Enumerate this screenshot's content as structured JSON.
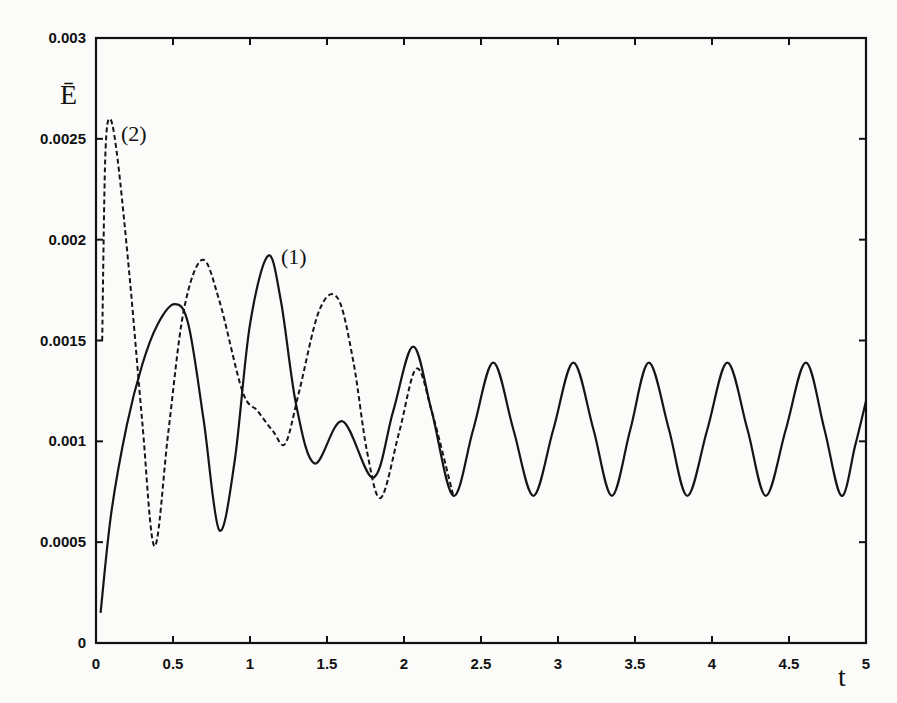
{
  "chart_data": {
    "type": "line",
    "title": "",
    "xlabel": "t",
    "ylabel": "Ē",
    "xlim": [
      0,
      5
    ],
    "ylim": [
      0,
      0.003
    ],
    "grid": false,
    "legend": "none (curves labeled inline)",
    "x_ticks": [
      "0",
      "0.5",
      "1",
      "1.5",
      "2",
      "2.5",
      "3",
      "3.5",
      "4",
      "4.5",
      "5"
    ],
    "y_ticks": [
      "0",
      "0.0005",
      "0.001",
      "0.0015",
      "0.002",
      "0.0025",
      "0.003"
    ],
    "annotations": [
      {
        "text": "(1)",
        "x": 1.21,
        "y": 0.00188,
        "refers_to": "series 1 (solid)"
      },
      {
        "text": "(2)",
        "x": 0.17,
        "y": 0.0025,
        "refers_to": "series 2 (dashed)"
      }
    ],
    "series": [
      {
        "name": "(1)",
        "style": "solid",
        "points": [
          [
            0.03,
            0.00015
          ],
          [
            0.1,
            0.00065
          ],
          [
            0.2,
            0.00108
          ],
          [
            0.3,
            0.00138
          ],
          [
            0.4,
            0.00158
          ],
          [
            0.51,
            0.00168
          ],
          [
            0.6,
            0.00158
          ],
          [
            0.7,
            0.0011
          ],
          [
            0.8,
            0.00056
          ],
          [
            0.9,
            0.0009
          ],
          [
            1.0,
            0.00158
          ],
          [
            1.117,
            0.00192
          ],
          [
            1.2,
            0.0017
          ],
          [
            1.3,
            0.00118
          ],
          [
            1.42,
            0.00089
          ],
          [
            1.6,
            0.0011
          ],
          [
            1.8,
            0.00082
          ],
          [
            1.93,
            0.00115
          ],
          [
            2.06,
            0.00147
          ],
          [
            2.18,
            0.00115
          ],
          [
            2.32,
            0.00073
          ],
          [
            2.45,
            0.00106
          ],
          [
            2.58,
            0.00139
          ],
          [
            2.71,
            0.00106
          ],
          [
            2.84,
            0.00073
          ],
          [
            2.97,
            0.00106
          ],
          [
            3.1,
            0.00139
          ],
          [
            3.23,
            0.00106
          ],
          [
            3.35,
            0.00073
          ],
          [
            3.47,
            0.00106
          ],
          [
            3.59,
            0.00139
          ],
          [
            3.72,
            0.00106
          ],
          [
            3.84,
            0.00073
          ],
          [
            3.97,
            0.00106
          ],
          [
            4.1,
            0.00139
          ],
          [
            4.23,
            0.00106
          ],
          [
            4.35,
            0.00073
          ],
          [
            4.48,
            0.00106
          ],
          [
            4.61,
            0.00139
          ],
          [
            4.73,
            0.00106
          ],
          [
            4.84,
            0.00073
          ],
          [
            4.93,
            0.00098
          ],
          [
            5.0,
            0.0012
          ]
        ]
      },
      {
        "name": "(2)",
        "style": "dashed",
        "points": [
          [
            0.04,
            0.0015
          ],
          [
            0.06,
            0.0024
          ],
          [
            0.09,
            0.0026
          ],
          [
            0.14,
            0.0024
          ],
          [
            0.22,
            0.0018
          ],
          [
            0.3,
            0.0011
          ],
          [
            0.38,
            0.00048
          ],
          [
            0.47,
            0.00105
          ],
          [
            0.57,
            0.00165
          ],
          [
            0.69,
            0.0019
          ],
          [
            0.8,
            0.0017
          ],
          [
            0.95,
            0.00125
          ],
          [
            1.05,
            0.00115
          ],
          [
            1.15,
            0.00105
          ],
          [
            1.23,
            0.00099
          ],
          [
            1.32,
            0.00125
          ],
          [
            1.45,
            0.00165
          ],
          [
            1.57,
            0.00171
          ],
          [
            1.67,
            0.0014
          ],
          [
            1.76,
            0.00095
          ],
          [
            1.85,
            0.00072
          ],
          [
            1.97,
            0.00105
          ],
          [
            2.08,
            0.00136
          ],
          [
            2.18,
            0.00115
          ],
          [
            2.32,
            0.00073
          ]
        ]
      }
    ]
  }
}
